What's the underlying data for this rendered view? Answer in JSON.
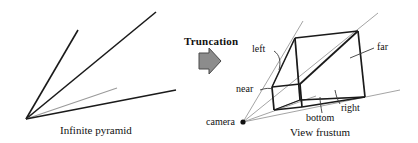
{
  "figure": {
    "width": 418,
    "height": 143,
    "background": "#ffffff",
    "ink": "#1a1a1a",
    "light_ink": "#9a9a9a",
    "arrow_fill": "#8c8c8c",
    "arrow_stroke": "#4a4a4a"
  },
  "left_panel": {
    "caption": "Infinite pyramid",
    "apex": {
      "x": 26,
      "y": 119
    },
    "rays": [
      {
        "name": "upper-left-edge",
        "x2": 78,
        "y2": 30,
        "weight": "heavy"
      },
      {
        "name": "upper-right-edge",
        "x2": 156,
        "y2": 12,
        "weight": "heavy"
      },
      {
        "name": "inner-axis",
        "x2": 117,
        "y2": 88,
        "weight": "light"
      },
      {
        "name": "lower-right-edge",
        "x2": 176,
        "y2": 90,
        "weight": "heavy"
      }
    ]
  },
  "transition": {
    "label": "Truncation",
    "icon": "right-block-arrow-icon"
  },
  "right_panel": {
    "caption": "View frustum",
    "camera_label": "camera",
    "camera_point": {
      "x": 243,
      "y": 122
    },
    "plane_labels": [
      {
        "key": "left",
        "text": "left"
      },
      {
        "key": "near",
        "text": "near"
      },
      {
        "key": "far",
        "text": "far"
      },
      {
        "key": "right",
        "text": "right"
      },
      {
        "key": "bottom",
        "text": "bottom"
      }
    ],
    "frustum_vertices": {
      "near_top_left": {
        "x": 272,
        "y": 87
      },
      "near_top_right": {
        "x": 300,
        "y": 84
      },
      "near_bottom_left": {
        "x": 274,
        "y": 110
      },
      "near_bottom_right": {
        "x": 302,
        "y": 107
      },
      "far_top_left": {
        "x": 295,
        "y": 38
      },
      "far_top_right": {
        "x": 358,
        "y": 31
      },
      "far_bottom_left": {
        "x": 300,
        "y": 100
      },
      "far_bottom_right": {
        "x": 365,
        "y": 97
      }
    }
  }
}
